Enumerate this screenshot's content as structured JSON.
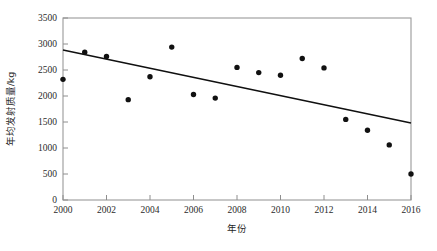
{
  "chart_data": {
    "type": "scatter",
    "title": "",
    "xlabel": "年份",
    "ylabel": "年均发射质量/kg",
    "xlim": [
      2000,
      2016
    ],
    "ylim": [
      0,
      3500
    ],
    "grid": false,
    "legend_position": "none",
    "x_ticks": [
      "2000",
      "2002",
      "2004",
      "2006",
      "2008",
      "2010",
      "2012",
      "2014",
      "2016"
    ],
    "x_tick_values": [
      2000,
      2002,
      2004,
      2006,
      2008,
      2010,
      2012,
      2014,
      2016
    ],
    "y_ticks": [
      "0",
      "500",
      "1000",
      "1500",
      "2000",
      "2500",
      "3000",
      "3500"
    ],
    "y_tick_values": [
      0,
      500,
      1000,
      1500,
      2000,
      2500,
      3000,
      3500
    ],
    "x": [
      2000,
      2001,
      2002,
      2003,
      2004,
      2005,
      2006,
      2007,
      2008,
      2009,
      2010,
      2011,
      2012,
      2013,
      2014,
      2015,
      2016
    ],
    "values": [
      2320,
      2840,
      2760,
      1930,
      2370,
      2940,
      2030,
      1960,
      2550,
      2450,
      2400,
      2720,
      2540,
      1550,
      1340,
      1060,
      500
    ],
    "series": [
      {
        "name": "年均发射质量",
        "type": "scatter",
        "marker": "filled-circle",
        "color": "#111111",
        "points": [
          {
            "x": 2000,
            "y": 2320
          },
          {
            "x": 2001,
            "y": 2840
          },
          {
            "x": 2002,
            "y": 2760
          },
          {
            "x": 2003,
            "y": 1930
          },
          {
            "x": 2004,
            "y": 2370
          },
          {
            "x": 2005,
            "y": 2940
          },
          {
            "x": 2006,
            "y": 2030
          },
          {
            "x": 2007,
            "y": 1960
          },
          {
            "x": 2008,
            "y": 2550
          },
          {
            "x": 2009,
            "y": 2450
          },
          {
            "x": 2010,
            "y": 2400
          },
          {
            "x": 2011,
            "y": 2720
          },
          {
            "x": 2012,
            "y": 2540
          },
          {
            "x": 2013,
            "y": 1550
          },
          {
            "x": 2014,
            "y": 1340
          },
          {
            "x": 2015,
            "y": 1060
          },
          {
            "x": 2016,
            "y": 500
          }
        ]
      },
      {
        "name": "趋势线",
        "type": "line",
        "color": "#101010",
        "points": [
          {
            "x": 2000,
            "y": 2885
          },
          {
            "x": 2016,
            "y": 1480
          }
        ]
      }
    ]
  },
  "axes": {
    "y_label": "年均发射质量/kg",
    "x_label": "年份"
  }
}
